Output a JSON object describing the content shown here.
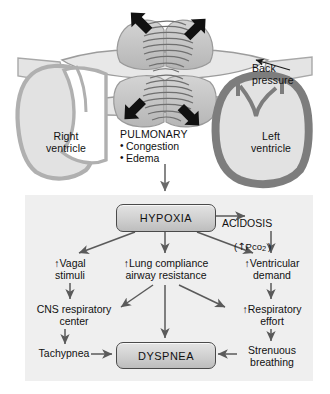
{
  "diagram": {
    "anatomy": {
      "right_ventricle_label": "Right\nventricle",
      "left_ventricle_label": "Left\nventricle",
      "back_pressure_label": "Back\npressure",
      "pulmonary": {
        "heading": "PULMONARY",
        "items": [
          "Congestion",
          "Edema"
        ]
      },
      "arrow_count_outward": 4,
      "icons": {
        "outward_arrow": "bold-black-arrow-icon",
        "back_pressure_arrow": "thin-leader-arrow-icon",
        "descending_arrow": "down-arrow-icon"
      }
    },
    "flow": {
      "nodes": {
        "hypoxia": "HYPOXIA",
        "dyspnea": "DYSPNEA",
        "acidosis_title": "ACIDOSIS",
        "acidosis_sub": "(↑Pco₂)",
        "acidosis_sub_prefix": "(↑P",
        "acidosis_sub_co": "CO",
        "acidosis_sub_suffix": ")",
        "vagal": "↑Vagal\nstimuli",
        "lung": "↑Lung compliance\nairway resistance",
        "ventricular_demand": "↑Ventricular\ndemand",
        "cns": "CNS respiratory\ncenter",
        "respiratory_effort": "↑Respiratory\neffort",
        "tachypnea": "Tachypnea",
        "strenuous": "Strenuous\nbreathing"
      },
      "edges": [
        {
          "from": "hypoxia",
          "to": "acidosis"
        },
        {
          "from": "hypoxia",
          "to": "vagal"
        },
        {
          "from": "hypoxia",
          "to": "lung"
        },
        {
          "from": "hypoxia",
          "to": "ventricular_demand"
        },
        {
          "from": "acidosis",
          "to": "ventricular_demand"
        },
        {
          "from": "vagal",
          "to": "cns"
        },
        {
          "from": "lung",
          "to": "cns"
        },
        {
          "from": "lung",
          "to": "dyspnea"
        },
        {
          "from": "lung",
          "to": "respiratory_effort"
        },
        {
          "from": "ventricular_demand",
          "to": "respiratory_effort"
        },
        {
          "from": "cns",
          "to": "tachypnea"
        },
        {
          "from": "respiratory_effort",
          "to": "strenuous"
        },
        {
          "from": "tachypnea",
          "to": "dyspnea"
        },
        {
          "from": "strenuous",
          "to": "dyspnea"
        }
      ]
    },
    "colors": {
      "panel_background": "#efefef",
      "box_fill": "#d2d2d2",
      "box_border": "#4a4a4a",
      "arrow": "#555555",
      "heart_wall_light": "#b9b9b9",
      "heart_fill_light": "#e2e2e2",
      "heart_wall_dark": "#808080",
      "lung_fill": "#c4c4c4",
      "bold_arrow": "#111111",
      "text": "#111111"
    }
  }
}
